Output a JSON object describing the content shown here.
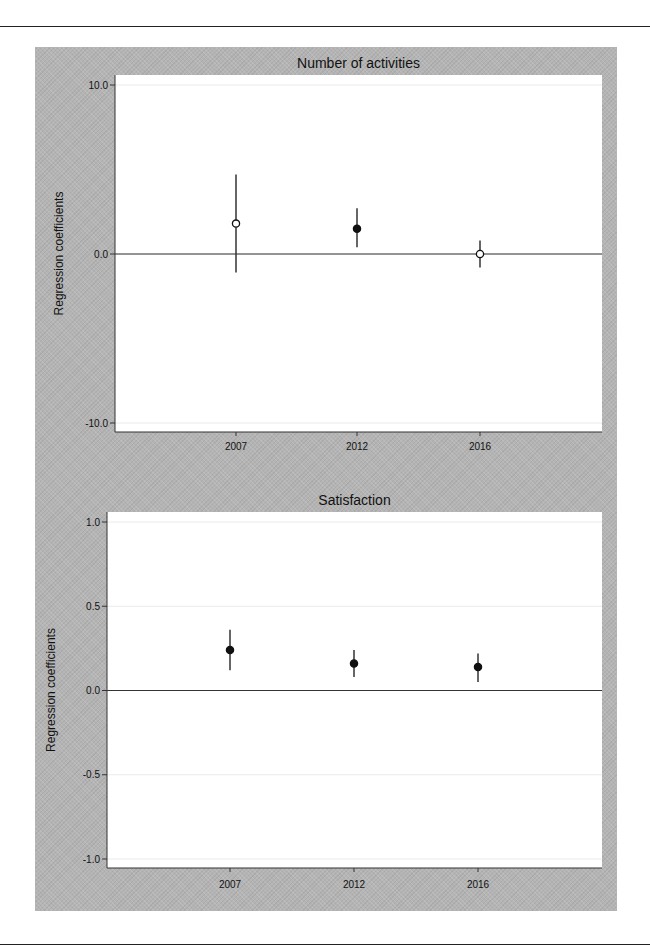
{
  "chart_data": [
    {
      "type": "scatter",
      "subtype": "coefficient plot with confidence intervals",
      "title": "Number of activities",
      "xlabel": "",
      "ylabel": "Regression coefficients",
      "categories": [
        "2007",
        "2012",
        "2016"
      ],
      "yticks": [
        "10.0",
        "0.0",
        "-10.0"
      ],
      "ylim": [
        -10,
        10
      ],
      "reference_line": 0,
      "grid": "light horizontal at ticks",
      "series": [
        {
          "name": "coefficient",
          "values": [
            1.8,
            1.5,
            0.0
          ],
          "ci_lower": [
            -1.1,
            0.4,
            -0.8
          ],
          "ci_upper": [
            4.7,
            2.7,
            0.8
          ],
          "marker_style": [
            "hollow",
            "filled",
            "hollow"
          ]
        }
      ]
    },
    {
      "type": "scatter",
      "subtype": "coefficient plot with confidence intervals",
      "title": "Satisfaction",
      "xlabel": "",
      "ylabel": "Regression coefficients",
      "categories": [
        "2007",
        "2012",
        "2016"
      ],
      "yticks": [
        "1.0",
        "0.5",
        "0.0",
        "-0.5",
        "-1.0"
      ],
      "ylim": [
        -1,
        1
      ],
      "reference_line": 0,
      "grid": "light horizontal at ticks",
      "series": [
        {
          "name": "coefficient",
          "values": [
            0.24,
            0.16,
            0.14
          ],
          "ci_lower": [
            0.12,
            0.08,
            0.05
          ],
          "ci_upper": [
            0.36,
            0.24,
            0.22
          ],
          "marker_style": [
            "filled",
            "filled",
            "filled"
          ]
        }
      ]
    }
  ]
}
